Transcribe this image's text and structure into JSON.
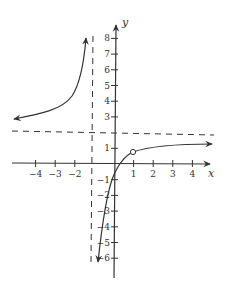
{
  "chart_data": {
    "type": "line",
    "title": "",
    "xlabel": "x",
    "ylabel": "y",
    "xlim": [
      -5,
      5
    ],
    "ylim": [
      -7,
      9
    ],
    "x_ticks": [
      "−4",
      "−3",
      "−2",
      "1",
      "2",
      "3",
      "4"
    ],
    "y_ticks": [
      "8",
      "7",
      "6",
      "5",
      "4",
      "3",
      "1",
      "−1",
      "−2",
      "−3",
      "−4",
      "−5",
      "−6"
    ],
    "asymptotes": {
      "vertical": -1,
      "horizontal": 2
    },
    "hole": {
      "x": 1,
      "y": 0.5
    },
    "series": [
      {
        "name": "left branch",
        "points": [
          [
            -5,
            2.7
          ],
          [
            -4,
            2.9
          ],
          [
            -3,
            3.3
          ],
          [
            -2,
            4.5
          ],
          [
            -1.5,
            6.0
          ],
          [
            -1.3,
            8.0
          ]
        ]
      },
      {
        "name": "right branch",
        "points": [
          [
            -0.8,
            -6.0
          ],
          [
            -0.5,
            -3.0
          ],
          [
            0,
            -1.0
          ],
          [
            0.5,
            0.0
          ],
          [
            1,
            0.5
          ],
          [
            2,
            1.0
          ],
          [
            3,
            1.2
          ],
          [
            4,
            1.35
          ],
          [
            5,
            1.45
          ]
        ]
      }
    ],
    "grid": false,
    "legend": null
  },
  "labels": {
    "x_axis": "x",
    "y_axis": "y",
    "x_ticks": [
      {
        "v": -4,
        "t": "−4"
      },
      {
        "v": -3,
        "t": "−3"
      },
      {
        "v": -2,
        "t": "−2"
      },
      {
        "v": 1,
        "t": "1"
      },
      {
        "v": 2,
        "t": "2"
      },
      {
        "v": 3,
        "t": "3"
      },
      {
        "v": 4,
        "t": "4"
      }
    ],
    "y_ticks": [
      {
        "v": 8,
        "t": "8"
      },
      {
        "v": 7,
        "t": "7"
      },
      {
        "v": 6,
        "t": "6"
      },
      {
        "v": 5,
        "t": "5"
      },
      {
        "v": 4,
        "t": "4"
      },
      {
        "v": 3,
        "t": "3"
      },
      {
        "v": 1,
        "t": "1"
      },
      {
        "v": -1,
        "t": "−1"
      },
      {
        "v": -2,
        "t": "−2"
      },
      {
        "v": -3,
        "t": "−3"
      },
      {
        "v": -4,
        "t": "−4"
      },
      {
        "v": -5,
        "t": "−5"
      },
      {
        "v": -6,
        "t": "−6"
      }
    ]
  }
}
